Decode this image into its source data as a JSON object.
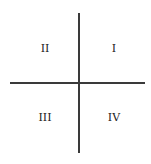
{
  "diagram": {
    "quadrants": [
      {
        "label": "I",
        "position": "top-right"
      },
      {
        "label": "II",
        "position": "top-left"
      },
      {
        "label": "III",
        "position": "bottom-left"
      },
      {
        "label": "IV",
        "position": "bottom-right"
      }
    ],
    "colors": {
      "axis": "#3a3a3a",
      "text": "#222222",
      "background": "#ffffff"
    }
  }
}
